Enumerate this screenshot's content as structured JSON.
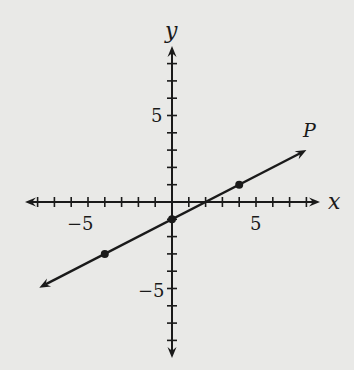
{
  "chart_data": {
    "type": "line",
    "title": "",
    "xlabel": "x",
    "ylabel": "y",
    "xlim": [
      -8,
      8
    ],
    "ylim": [
      -8,
      8
    ],
    "grid": false,
    "x_ticks": [
      -8,
      -7,
      -6,
      -5,
      -4,
      -3,
      -2,
      -1,
      1,
      2,
      3,
      4,
      5,
      6,
      7,
      8
    ],
    "y_ticks": [
      -8,
      -7,
      -6,
      -5,
      -4,
      -3,
      -2,
      -1,
      1,
      2,
      3,
      4,
      5,
      6,
      7,
      8
    ],
    "x_tick_labels": [
      {
        "value": -5,
        "text": "−5"
      },
      {
        "value": 5,
        "text": "5"
      }
    ],
    "y_tick_labels": [
      {
        "value": 5,
        "text": "5"
      },
      {
        "value": -5,
        "text": "−5"
      }
    ],
    "series": [
      {
        "name": "P",
        "equation": "y = 0.5x - 1",
        "slope": 0.5,
        "intercept": -1,
        "x_range": [
          -7.9,
          8.0
        ],
        "arrows": "both",
        "marked_points": [
          [
            -4,
            -3
          ],
          [
            0,
            -1
          ],
          [
            4,
            1
          ]
        ]
      }
    ],
    "annotations": [
      {
        "text": "P",
        "x": 8.2,
        "y": 4.1
      }
    ]
  },
  "style": {
    "background": "#e9e9e7",
    "ink": "#1a1a1a"
  }
}
